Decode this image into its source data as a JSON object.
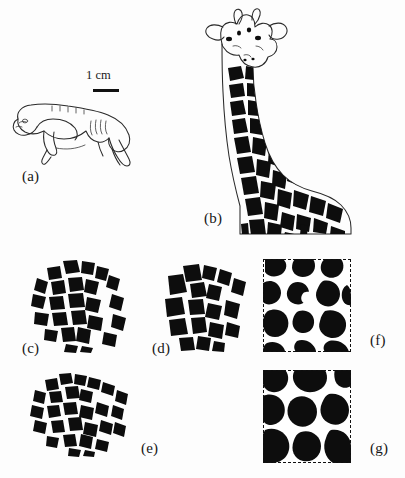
{
  "figure": {
    "background_color": "#fdfdfd",
    "ink_color": "#0d0d0d",
    "width": 405,
    "height": 478
  },
  "scale_bar": {
    "label": "1 cm",
    "length_px": 26
  },
  "panels": [
    {
      "id": "a",
      "label": "(a)",
      "caption_text": "(a)",
      "kind": "line-drawing",
      "subject": "giraffe-embryo-outline",
      "label_x": 22,
      "label_y": 168,
      "has_scale_bar": true
    },
    {
      "id": "b",
      "label": "(b)",
      "caption_text": "(b)",
      "kind": "silhouette-pattern",
      "subject": "adult-reticulated-giraffe",
      "label_x": 204,
      "label_y": 210
    },
    {
      "id": "c",
      "label": "(c)",
      "caption_text": "(c)",
      "kind": "patch-cluster",
      "subject": "medium-polygonal-patches",
      "label_x": 22,
      "label_y": 340
    },
    {
      "id": "d",
      "label": "(d)",
      "caption_text": "(d)",
      "kind": "patch-cluster",
      "subject": "medium-polygonal-patches",
      "label_x": 152,
      "label_y": 340
    },
    {
      "id": "e",
      "label": "(e)",
      "caption_text": "(e)",
      "kind": "patch-cluster",
      "subject": "fine-fragmented-patches",
      "label_x": 141,
      "label_y": 440
    },
    {
      "id": "f",
      "label": "(f)",
      "caption_text": "(f)",
      "kind": "simulation-domain",
      "subject": "reaction-diffusion-blobs",
      "label_x": 370,
      "label_y": 332,
      "frame": "dashed"
    },
    {
      "id": "g",
      "label": "(g)",
      "caption_text": "(g)",
      "kind": "simulation-domain",
      "subject": "reaction-diffusion-large-blobs",
      "label_x": 370,
      "label_y": 440,
      "frame": "dashed"
    }
  ]
}
